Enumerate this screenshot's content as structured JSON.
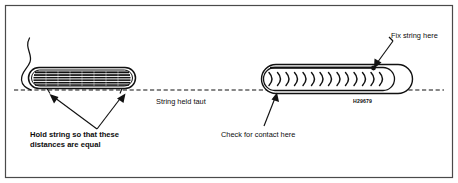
{
  "figure": {
    "border_color": "#444444",
    "ink_color": "#111111",
    "background": "#ffffff",
    "width": 458,
    "height": 183
  },
  "labels": {
    "fix_string": "Fix string here",
    "string_taut": "String held taut",
    "hold_string_line1": "Hold string so that these",
    "hold_string_line2": "distances are equal",
    "check_contact": "Check for contact here",
    "part_code": "H29679"
  },
  "parts": {
    "left_spring": {
      "name": "coiled-spring-side-view",
      "stripe_count": 7,
      "x": 28,
      "y": 67,
      "width": 108,
      "height": 22
    },
    "right_spring": {
      "name": "coiled-spring-chevron-view",
      "chevron_count": 14,
      "x": 262,
      "y": 64,
      "width": 150,
      "height": 30
    },
    "string": {
      "name": "taut-string",
      "style": "dashed",
      "y": 90,
      "x_start": 14,
      "x_end": 444
    }
  },
  "annotations": [
    {
      "id": "fix-string-here",
      "target": "right-spring-top-contact",
      "style": "solid-arrow"
    },
    {
      "id": "check-for-contact-here",
      "target": "right-spring-bottom-contact",
      "style": "leader-line"
    },
    {
      "id": "hold-string-equal-distances",
      "target": "left-spring-both-ends",
      "style": "double-arrow"
    },
    {
      "id": "string-tail",
      "target": "off-page-left",
      "style": "free-curve"
    }
  ]
}
